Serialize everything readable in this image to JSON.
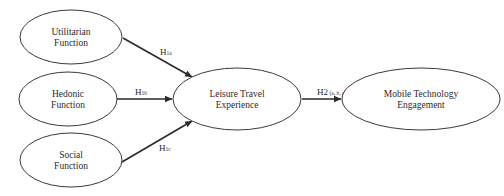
{
  "diagram": {
    "type": "research-model",
    "nodes": [
      {
        "id": "utilitarian",
        "line1": "Utilitarian",
        "line2": "Function",
        "cx": 71,
        "cy": 37,
        "rx": 51,
        "ry": 27
      },
      {
        "id": "hedonic",
        "line1": "Hedonic",
        "line2": "Function",
        "cx": 68,
        "cy": 99,
        "rx": 49,
        "ry": 27
      },
      {
        "id": "social",
        "line1": "Social",
        "line2": "Function",
        "cx": 71,
        "cy": 160,
        "rx": 51,
        "ry": 27
      },
      {
        "id": "leisure",
        "line1": "Leisure Travel",
        "line2": "Experience",
        "cx": 237,
        "cy": 99,
        "rx": 64,
        "ry": 31
      },
      {
        "id": "mobile",
        "line1": "Mobile Technology",
        "line2": "Engagement",
        "cx": 421,
        "cy": 99,
        "rx": 79,
        "ry": 31
      }
    ],
    "edges": [
      {
        "id": "h1a",
        "from": "utilitarian",
        "to": "leisure",
        "label_main": "H",
        "label_sub": "1a",
        "label_full": "H1a"
      },
      {
        "id": "h1b",
        "from": "hedonic",
        "to": "leisure",
        "label_main": "H",
        "label_sub": "1b",
        "label_full": "H1b"
      },
      {
        "id": "h1c",
        "from": "social",
        "to": "leisure",
        "label_main": "H",
        "label_sub": "1c",
        "label_full": "H1c"
      },
      {
        "id": "h2",
        "from": "leisure",
        "to": "mobile",
        "label_main": "H2",
        "label_sub": " (a, b, c)",
        "label_full": "H2 (a, b, c)"
      }
    ],
    "colors": {
      "stroke": "#2a2a2a",
      "background": "#ffffff"
    }
  }
}
